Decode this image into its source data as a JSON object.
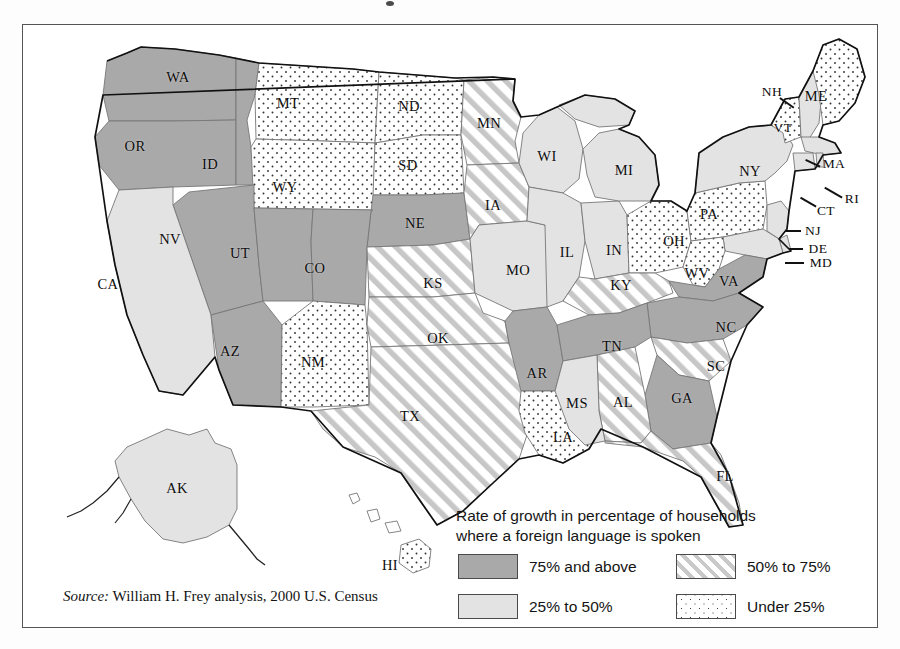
{
  "figure": {
    "kind": "thematic-choropleth-map",
    "region": "United States",
    "source_prefix": "Source:",
    "source_text": "William H. Frey analysis, 2000 U.S. Census"
  },
  "legend": {
    "title_line1": "Rate of growth in percentage of households",
    "title_line2": "where a foreign language is spoken",
    "entries": [
      {
        "key": "above75",
        "label": "75% and above",
        "pattern": "solid-dark-gray",
        "color": "#a9a9a9"
      },
      {
        "key": "50to75",
        "label": "50% to 75%",
        "pattern": "diagonal-hatch",
        "color": "#c9c9c9"
      },
      {
        "key": "25to50",
        "label": "25% to 50%",
        "pattern": "solid-light-gray",
        "color": "#e3e3e3"
      },
      {
        "key": "under25",
        "label": "Under 25%",
        "pattern": "stipple-dots",
        "color": "#3a3a3a"
      }
    ]
  },
  "chart_data": {
    "type": "map",
    "title": "Rate of growth in percentage of households where a foreign language is spoken",
    "value_type": "categorical-bin",
    "bins": [
      "75% and above",
      "50% to 75%",
      "25% to 50%",
      "Under 25%"
    ],
    "states": [
      {
        "code": "WA",
        "bin": "75% and above"
      },
      {
        "code": "OR",
        "bin": "75% and above"
      },
      {
        "code": "ID",
        "bin": "75% and above"
      },
      {
        "code": "NV",
        "bin": "75% and above"
      },
      {
        "code": "UT",
        "bin": "75% and above"
      },
      {
        "code": "AZ",
        "bin": "75% and above"
      },
      {
        "code": "CO",
        "bin": "75% and above"
      },
      {
        "code": "NE",
        "bin": "75% and above"
      },
      {
        "code": "AR",
        "bin": "75% and above"
      },
      {
        "code": "TN",
        "bin": "75% and above"
      },
      {
        "code": "GA",
        "bin": "75% and above"
      },
      {
        "code": "NC",
        "bin": "75% and above"
      },
      {
        "code": "VA",
        "bin": "75% and above"
      },
      {
        "code": "MN",
        "bin": "50% to 75%"
      },
      {
        "code": "IA",
        "bin": "50% to 75%"
      },
      {
        "code": "KS",
        "bin": "50% to 75%"
      },
      {
        "code": "OK",
        "bin": "50% to 75%"
      },
      {
        "code": "TX",
        "bin": "50% to 75%"
      },
      {
        "code": "KY",
        "bin": "50% to 75%"
      },
      {
        "code": "AL",
        "bin": "50% to 75%"
      },
      {
        "code": "SC",
        "bin": "50% to 75%"
      },
      {
        "code": "FL",
        "bin": "50% to 75%"
      },
      {
        "code": "CA",
        "bin": "25% to 50%"
      },
      {
        "code": "WI",
        "bin": "25% to 50%"
      },
      {
        "code": "MI",
        "bin": "25% to 50%"
      },
      {
        "code": "IL",
        "bin": "25% to 50%"
      },
      {
        "code": "IN",
        "bin": "25% to 50%"
      },
      {
        "code": "MO",
        "bin": "25% to 50%"
      },
      {
        "code": "MS",
        "bin": "25% to 50%"
      },
      {
        "code": "NY",
        "bin": "25% to 50%"
      },
      {
        "code": "NJ",
        "bin": "25% to 50%"
      },
      {
        "code": "MD",
        "bin": "25% to 50%"
      },
      {
        "code": "DE",
        "bin": "25% to 50%"
      },
      {
        "code": "RI",
        "bin": "25% to 50%"
      },
      {
        "code": "CT",
        "bin": "25% to 50%"
      },
      {
        "code": "MA",
        "bin": "25% to 50%"
      },
      {
        "code": "NH",
        "bin": "25% to 50%"
      },
      {
        "code": "AK",
        "bin": "25% to 50%"
      },
      {
        "code": "MT",
        "bin": "Under 25%"
      },
      {
        "code": "WY",
        "bin": "Under 25%"
      },
      {
        "code": "ND",
        "bin": "Under 25%"
      },
      {
        "code": "SD",
        "bin": "Under 25%"
      },
      {
        "code": "NM",
        "bin": "Under 25%"
      },
      {
        "code": "LA",
        "bin": "Under 25%"
      },
      {
        "code": "OH",
        "bin": "Under 25%"
      },
      {
        "code": "WV",
        "bin": "Under 25%"
      },
      {
        "code": "PA",
        "bin": "Under 25%"
      },
      {
        "code": "VT",
        "bin": "Under 25%"
      },
      {
        "code": "ME",
        "bin": "Under 25%"
      },
      {
        "code": "HI",
        "bin": "Under 25%"
      }
    ]
  },
  "map_labels": [
    {
      "code": "WA",
      "x": 155,
      "y": 52
    },
    {
      "code": "OR",
      "x": 112,
      "y": 121
    },
    {
      "code": "ID",
      "x": 187,
      "y": 139
    },
    {
      "code": "MT",
      "x": 265,
      "y": 78
    },
    {
      "code": "ND",
      "x": 386,
      "y": 81
    },
    {
      "code": "SD",
      "x": 385,
      "y": 140
    },
    {
      "code": "WY",
      "x": 262,
      "y": 162
    },
    {
      "code": "NV",
      "x": 147,
      "y": 214
    },
    {
      "code": "UT",
      "x": 217,
      "y": 228
    },
    {
      "code": "CO",
      "x": 292,
      "y": 243
    },
    {
      "code": "NE",
      "x": 392,
      "y": 198
    },
    {
      "code": "CA",
      "x": 85,
      "y": 259
    },
    {
      "code": "AZ",
      "x": 207,
      "y": 326
    },
    {
      "code": "NM",
      "x": 290,
      "y": 337
    },
    {
      "code": "KS",
      "x": 410,
      "y": 258
    },
    {
      "code": "OK",
      "x": 415,
      "y": 313
    },
    {
      "code": "TX",
      "x": 387,
      "y": 391
    },
    {
      "code": "MN",
      "x": 466,
      "y": 98
    },
    {
      "code": "IA",
      "x": 470,
      "y": 180
    },
    {
      "code": "WI",
      "x": 524,
      "y": 131
    },
    {
      "code": "MI",
      "x": 601,
      "y": 145
    },
    {
      "code": "IL",
      "x": 544,
      "y": 227
    },
    {
      "code": "IN",
      "x": 591,
      "y": 225
    },
    {
      "code": "MO",
      "x": 495,
      "y": 245
    },
    {
      "code": "KY",
      "x": 598,
      "y": 260
    },
    {
      "code": "OH",
      "x": 651,
      "y": 216
    },
    {
      "code": "WV",
      "x": 674,
      "y": 248
    },
    {
      "code": "TN",
      "x": 589,
      "y": 321
    },
    {
      "code": "AR",
      "x": 514,
      "y": 348
    },
    {
      "code": "MS",
      "x": 554,
      "y": 378
    },
    {
      "code": "AL",
      "x": 600,
      "y": 377
    },
    {
      "code": "GA",
      "x": 659,
      "y": 373
    },
    {
      "code": "SC",
      "x": 693,
      "y": 341
    },
    {
      "code": "NC",
      "x": 703,
      "y": 302
    },
    {
      "code": "VA",
      "x": 706,
      "y": 256
    },
    {
      "code": "LA",
      "x": 540,
      "y": 412
    },
    {
      "code": "FL",
      "x": 702,
      "y": 451
    },
    {
      "code": "PA",
      "x": 686,
      "y": 189
    },
    {
      "code": "NY",
      "x": 727,
      "y": 146
    },
    {
      "code": "VT",
      "x": 760,
      "y": 103
    },
    {
      "code": "NH",
      "x": 749,
      "y": 67
    },
    {
      "code": "ME",
      "x": 793,
      "y": 71
    },
    {
      "code": "MA",
      "x": 811,
      "y": 139
    },
    {
      "code": "RI",
      "x": 829,
      "y": 174
    },
    {
      "code": "CT",
      "x": 803,
      "y": 186
    },
    {
      "code": "NJ",
      "x": 790,
      "y": 206
    },
    {
      "code": "DE",
      "x": 795,
      "y": 224
    },
    {
      "code": "MD",
      "x": 798,
      "y": 238
    },
    {
      "code": "AK",
      "x": 154,
      "y": 463
    },
    {
      "code": "HI",
      "x": 367,
      "y": 540
    }
  ]
}
